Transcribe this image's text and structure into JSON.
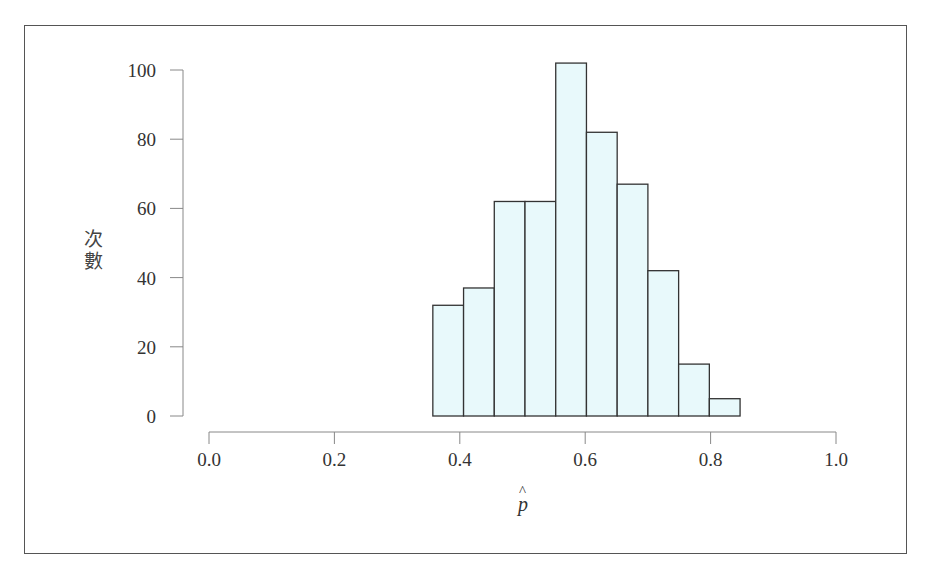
{
  "chart_data": {
    "type": "bar",
    "subtype": "histogram",
    "title": "",
    "xlabel": "p̂",
    "ylabel": "次數",
    "xlim": [
      0.0,
      1.0
    ],
    "ylim": [
      0,
      100
    ],
    "xticks": [
      "0.0",
      "0.2",
      "0.4",
      "0.6",
      "0.8",
      "1.0"
    ],
    "yticks": [
      "0",
      "20",
      "40",
      "60",
      "80",
      "100"
    ],
    "bin_edges": [
      0.357,
      0.406,
      0.455,
      0.504,
      0.553,
      0.602,
      0.651,
      0.7,
      0.749,
      0.798,
      0.847
    ],
    "values": [
      32,
      37,
      62,
      62,
      102,
      82,
      67,
      42,
      15,
      5
    ],
    "grid": false,
    "legend": null,
    "colors": {
      "bar_fill": "#e8f9fb",
      "bar_edge": "#333333",
      "axis": "#888888",
      "frame": "#555555"
    }
  },
  "labels": {
    "xlabel_base": "p",
    "xlabel_hat": "^",
    "ylabel_line1": "次",
    "ylabel_line2": "數"
  }
}
